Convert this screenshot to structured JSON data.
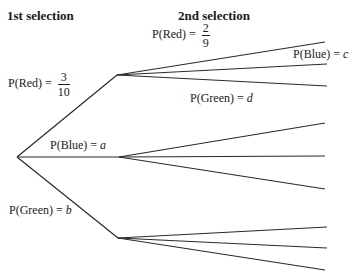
{
  "headings": {
    "first": "1st selection",
    "second": "2nd selection"
  },
  "first_selection": [
    {
      "color": "Red",
      "label": "P(Red) = ",
      "numerator": "3",
      "denominator": "10"
    },
    {
      "color": "Blue",
      "label": "P(Blue) = ",
      "variable": "a"
    },
    {
      "color": "Green",
      "label": "P(Green) = ",
      "variable": "b"
    }
  ],
  "second_selection_labels": [
    {
      "color": "Red",
      "label": "P(Red) = ",
      "numerator": "2",
      "denominator": "9"
    },
    {
      "color": "Blue",
      "label": "P(Blue) = ",
      "variable": "c"
    },
    {
      "color": "Green",
      "label": "P(Green) = ",
      "variable": "d"
    }
  ],
  "tree": {
    "root": [
      17,
      157
    ],
    "nodes": [
      [
        117,
        75
      ],
      [
        119,
        157
      ],
      [
        118,
        238
      ]
    ],
    "leaves": [
      [
        [
          325,
          42
        ],
        [
          327,
          64
        ],
        [
          327,
          86
        ]
      ],
      [
        [
          325,
          123
        ],
        [
          325,
          156
        ],
        [
          325,
          189
        ]
      ],
      [
        [
          327,
          227
        ],
        [
          327,
          248
        ],
        [
          325,
          270
        ]
      ]
    ]
  }
}
